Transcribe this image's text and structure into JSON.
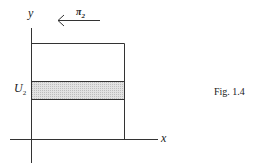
{
  "figure": {
    "caption": "Fig. 1.4",
    "y_axis_label": "y",
    "x_axis_label": "x",
    "arrow_label": "π",
    "arrow_label_sub": "2",
    "band_label": "U",
    "band_label_sub": "2",
    "colors": {
      "stroke": "#333333",
      "band_fill": "#d8d8d8"
    }
  }
}
